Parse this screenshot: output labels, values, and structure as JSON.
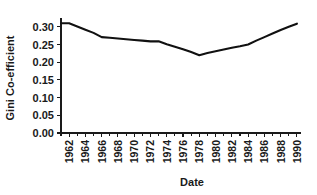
{
  "chart_data": {
    "type": "line",
    "title": "",
    "xlabel": "Date",
    "ylabel": "Gini Co-efficient",
    "xlim": [
      1961,
      1990.5
    ],
    "ylim": [
      0.0,
      0.325
    ],
    "grid": false,
    "legend": null,
    "line_color": "#111111",
    "x": [
      1961,
      1962,
      1963,
      1964,
      1965,
      1966,
      1967,
      1968,
      1969,
      1970,
      1971,
      1972,
      1973,
      1974,
      1975,
      1976,
      1977,
      1978,
      1979,
      1980,
      1981,
      1982,
      1983,
      1984,
      1985,
      1986,
      1987,
      1988,
      1989,
      1990
    ],
    "values": [
      0.31,
      0.31,
      0.301,
      0.292,
      0.283,
      0.271,
      0.269,
      0.267,
      0.265,
      0.263,
      0.261,
      0.259,
      0.259,
      0.251,
      0.244,
      0.237,
      0.229,
      0.22,
      0.226,
      0.231,
      0.236,
      0.241,
      0.245,
      0.25,
      0.261,
      0.271,
      0.281,
      0.291,
      0.3,
      0.309
    ],
    "y_ticks": [
      0.0,
      0.05,
      0.1,
      0.15,
      0.2,
      0.25,
      0.3
    ],
    "y_tick_labels": [
      "0.00",
      "0.05",
      "0.10",
      "0.15",
      "0.20",
      "0.25",
      "0.30"
    ],
    "x_ticks": [
      1962,
      1964,
      1966,
      1968,
      1970,
      1972,
      1974,
      1976,
      1978,
      1980,
      1982,
      1984,
      1986,
      1988,
      1990
    ],
    "x_tick_labels": [
      "1962",
      "1964",
      "1966",
      "1968",
      "1970",
      "1972",
      "1974",
      "1976",
      "1978",
      "1980",
      "1982",
      "1984",
      "1986",
      "1988",
      "1990"
    ],
    "x_minor_ticks": [
      1961,
      1963,
      1965,
      1967,
      1969,
      1971,
      1973,
      1975,
      1977,
      1979,
      1981,
      1983,
      1985,
      1987,
      1989
    ]
  }
}
